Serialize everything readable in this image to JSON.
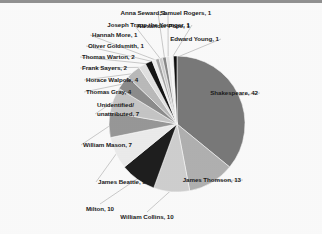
{
  "chart_data": {
    "type": "pie",
    "title": "",
    "subtitle": "",
    "xlabel": "",
    "ylabel": "",
    "legend_position": "none",
    "grid": false,
    "total": 117,
    "start_angle_deg": 0,
    "direction": "clockwise",
    "categories": [
      "Shakespeare",
      "James Thomson",
      "William Collins",
      "Milton",
      "James Beattie",
      "William Mason",
      "Unidentified/\nunattributed",
      "Thomas Gray",
      "Horace Walpole",
      "Frank Sayers",
      "Thomas Warton",
      "Oliver Goldsmith",
      "Hannah More",
      "Alexander Pope",
      "Samuel Rogers",
      "Anna Seward",
      "Joseph Trapp the Younger",
      "Edward Young"
    ],
    "values": [
      42,
      13,
      10,
      10,
      9,
      7,
      7,
      4,
      4,
      2,
      2,
      1,
      1,
      1,
      1,
      1,
      1,
      1
    ],
    "slice_colors": [
      "#7b7b7b",
      "#b3b3b3",
      "#d2d2d2",
      "#1f1f1f",
      "#efefef",
      "#9a9a9a",
      "#c8c8c8",
      "#8e8e8e",
      "#bdbdbd",
      "#e4e4e4",
      "#151515",
      "#f2f2f2",
      "#a6a6a6",
      "#cfcfcf",
      "#8a8a8a",
      "#e8e8e8",
      "#fafafa",
      "#101010"
    ],
    "labels": [
      {
        "text": "Shakespeare, 42",
        "align": "left",
        "x": 258,
        "y": 89,
        "leader": true
      },
      {
        "text": "James Thomson, 13",
        "align": "left",
        "x": 241,
        "y": 176,
        "leader": true
      },
      {
        "text": "William Collins, 10",
        "align": "center",
        "x": 147,
        "y": 213,
        "leader": true
      },
      {
        "text": "Milton, 10",
        "align": "center",
        "x": 100,
        "y": 205,
        "leader": true
      },
      {
        "text": "James Beattie, 9",
        "align": "right",
        "x": 98,
        "y": 178,
        "leader": true
      },
      {
        "text": "William Mason, 7",
        "align": "right",
        "x": 83,
        "y": 141,
        "leader": true
      },
      {
        "text": "Unidentified/",
        "align": "right",
        "x": 97,
        "y": 101,
        "leader": false
      },
      {
        "text": "unattributed, 7",
        "align": "right",
        "x": 97,
        "y": 110,
        "leader": true
      },
      {
        "text": "Thomas Gray, 4",
        "align": "right",
        "x": 86,
        "y": 88,
        "leader": true
      },
      {
        "text": "Horace Walpole, 4",
        "align": "right",
        "x": 86,
        "y": 76,
        "leader": true
      },
      {
        "text": "Frank Sayers, 2",
        "align": "right",
        "x": 82,
        "y": 64,
        "leader": true
      },
      {
        "text": "Thomas Warton, 2",
        "align": "right",
        "x": 82,
        "y": 53,
        "leader": true
      },
      {
        "text": "Oliver Goldsmith, 1",
        "align": "right",
        "x": 88,
        "y": 42,
        "leader": true
      },
      {
        "text": "Hannah More, 1",
        "align": "right",
        "x": 92,
        "y": 31,
        "leader": true
      },
      {
        "text": "Alexander Pope, 1",
        "align": "right",
        "x": 137,
        "y": 22,
        "leader": true
      },
      {
        "text": "Samuel Rogers, 1",
        "align": "right",
        "x": 160,
        "y": 9,
        "leader": true
      },
      {
        "text": "Anna Seward, 1",
        "align": "left",
        "x": 166,
        "y": 9,
        "leader": true
      },
      {
        "text": "Joseph Trapp the Younger, 1",
        "align": "left",
        "x": 190,
        "y": 21,
        "leader": true
      },
      {
        "text": "Edward Young, 1",
        "align": "left",
        "x": 219,
        "y": 35,
        "leader": true
      }
    ]
  }
}
